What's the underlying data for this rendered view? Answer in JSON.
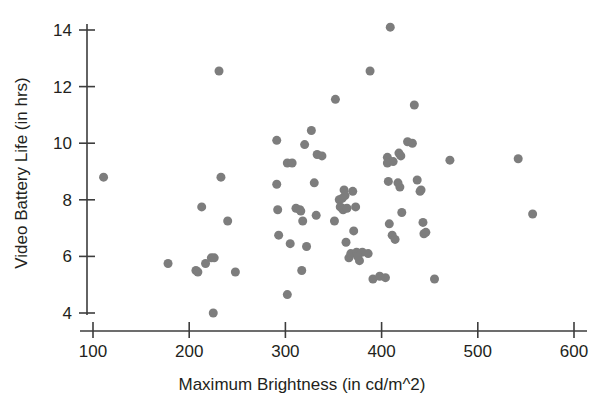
{
  "chart_data": {
    "type": "scatter",
    "title": "",
    "xlabel": "Maximum Brightness (in cd/m^2)",
    "ylabel": "Video Battery Life (in hrs)",
    "xlim": [
      100,
      605
    ],
    "ylim": [
      3.6,
      14.6
    ],
    "xticks": [
      100,
      200,
      300,
      400,
      500,
      600
    ],
    "xtick_labels": [
      "100",
      "200",
      "300",
      "400",
      "500",
      "600"
    ],
    "yticks": [
      4,
      6,
      8,
      10,
      12,
      14
    ],
    "ytick_labels": [
      "4",
      "6",
      "8",
      "10",
      "12",
      "14"
    ],
    "grid": false,
    "legend": null,
    "marker": "circle",
    "marker_color": "#7d7d7d",
    "marker_size": 6,
    "n_points": 84,
    "points": [
      [
        111,
        8.8
      ],
      [
        178,
        5.75
      ],
      [
        207,
        5.5
      ],
      [
        209,
        5.45
      ],
      [
        213,
        7.75
      ],
      [
        217,
        5.75
      ],
      [
        223,
        5.95
      ],
      [
        226,
        5.95
      ],
      [
        225,
        4.0
      ],
      [
        231,
        12.55
      ],
      [
        233,
        8.8
      ],
      [
        240,
        7.25
      ],
      [
        248,
        5.45
      ],
      [
        291,
        10.1
      ],
      [
        291,
        8.55
      ],
      [
        292,
        7.65
      ],
      [
        293,
        6.75
      ],
      [
        302,
        9.3
      ],
      [
        302,
        4.65
      ],
      [
        307,
        9.3
      ],
      [
        305,
        6.45
      ],
      [
        311,
        7.7
      ],
      [
        315,
        7.65
      ],
      [
        318,
        7.25
      ],
      [
        317,
        5.5
      ],
      [
        320,
        9.95
      ],
      [
        322,
        6.35
      ],
      [
        327,
        10.45
      ],
      [
        330,
        8.6
      ],
      [
        332,
        7.45
      ],
      [
        333,
        9.6
      ],
      [
        352,
        11.55
      ],
      [
        351,
        7.25
      ],
      [
        356,
        8.0
      ],
      [
        357,
        7.75
      ],
      [
        359,
        7.7
      ],
      [
        361,
        8.35
      ],
      [
        362,
        8.15
      ],
      [
        363,
        6.5
      ],
      [
        366,
        5.95
      ],
      [
        368,
        6.1
      ],
      [
        371,
        6.9
      ],
      [
        373,
        7.75
      ],
      [
        374,
        6.15
      ],
      [
        377,
        5.85
      ],
      [
        380,
        6.15
      ],
      [
        388,
        12.55
      ],
      [
        391,
        5.2
      ],
      [
        398,
        5.3
      ],
      [
        406,
        9.5
      ],
      [
        406,
        9.3
      ],
      [
        407,
        8.65
      ],
      [
        408,
        7.15
      ],
      [
        409,
        14.1
      ],
      [
        411,
        6.75
      ],
      [
        414,
        6.6
      ],
      [
        418,
        9.65
      ],
      [
        419,
        8.45
      ],
      [
        421,
        7.55
      ],
      [
        427,
        10.05
      ],
      [
        434,
        11.35
      ],
      [
        437,
        8.7
      ],
      [
        441,
        8.35
      ],
      [
        443,
        7.2
      ],
      [
        444,
        6.8
      ],
      [
        455,
        5.2
      ],
      [
        471,
        9.4
      ],
      [
        542,
        9.45
      ],
      [
        557,
        7.5
      ],
      [
        359,
        8.05
      ],
      [
        360,
        7.65
      ],
      [
        375,
        6.0
      ],
      [
        386,
        6.1
      ],
      [
        412,
        9.35
      ],
      [
        420,
        9.55
      ],
      [
        338,
        9.55
      ],
      [
        404,
        5.25
      ],
      [
        316,
        7.6
      ],
      [
        364,
        7.7
      ],
      [
        370,
        8.3
      ],
      [
        417,
        8.6
      ],
      [
        432,
        10.0
      ],
      [
        440,
        8.3
      ],
      [
        446,
        6.85
      ]
    ]
  },
  "axes": {
    "x_axis_name": "x-axis",
    "y_axis_name": "y-axis"
  }
}
